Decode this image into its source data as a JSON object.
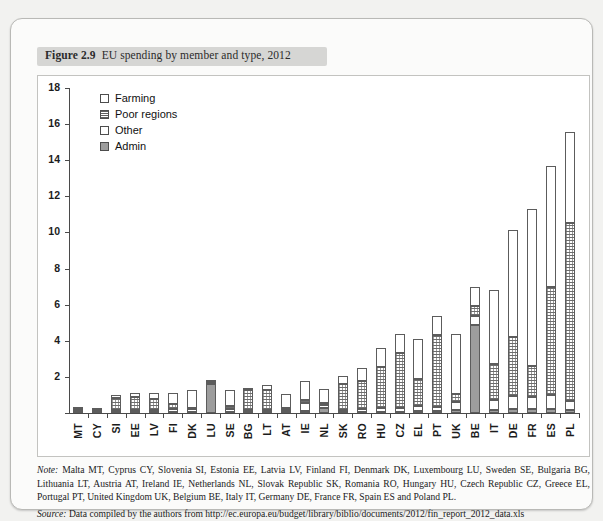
{
  "figure": {
    "label": "Figure 2.9",
    "title": "EU spending by member and type, 2012"
  },
  "note": {
    "prefix": "Note:",
    "text": "Malta MT, Cyprus CY, Slovenia SI, Estonia EE, Latvia LV, Finland FI, Denmark DK, Luxembourg LU, Sweden SE, Bulgaria BG, Lithuania LT, Austria AT, Ireland IE, Netherlands NL, Slovak Republic SK, Romania RO, Hungary HU, Czech Republic CZ, Greece EL, Portugal PT, United Kingdom UK, Belgium BE, Italy IT, Germany DE, France FR, Spain ES and Poland PL."
  },
  "source": {
    "prefix": "Source:",
    "text": "Data compiled by the authors from http://ec.europa.eu/budget/library/biblio/documents/2012/fin_report_2012_data.xls"
  },
  "chart_data": {
    "type": "bar",
    "stacked": true,
    "title": "EU spending by member and type, 2012",
    "xlabel": "",
    "ylabel": "",
    "ylim": [
      0,
      18
    ],
    "yticks": [
      0,
      2,
      4,
      6,
      8,
      10,
      12,
      14,
      16,
      18
    ],
    "grid": false,
    "legend_position": "top-left",
    "categories": [
      "MT",
      "CY",
      "SI",
      "EE",
      "LV",
      "FI",
      "DK",
      "LU",
      "SE",
      "BG",
      "LT",
      "AT",
      "IE",
      "NL",
      "SK",
      "RO",
      "HU",
      "CZ",
      "EL",
      "PT",
      "UK",
      "BE",
      "IT",
      "DE",
      "FR",
      "ES",
      "PL"
    ],
    "series": [
      {
        "name": "Farming",
        "color": "#ffffff",
        "pattern": "empty",
        "values": [
          0.05,
          0.03,
          0.15,
          0.2,
          0.3,
          0.6,
          0.95,
          0.05,
          0.85,
          0.15,
          0.25,
          0.75,
          1.05,
          0.8,
          0.45,
          0.7,
          1.05,
          1.1,
          2.2,
          1.1,
          3.35,
          1.1,
          4.1,
          5.95,
          8.7,
          6.7,
          5.0
        ]
      },
      {
        "name": "Poor regions",
        "color": "#ffffff",
        "pattern": "hatched",
        "values": [
          0.1,
          0.1,
          0.7,
          0.75,
          0.65,
          0.25,
          0.08,
          0.05,
          0.18,
          1.1,
          1.15,
          0.12,
          0.15,
          0.1,
          1.45,
          1.6,
          2.25,
          3.0,
          1.5,
          3.95,
          0.45,
          0.55,
          2.0,
          3.25,
          1.7,
          6.0,
          9.9
        ]
      },
      {
        "name": "Other",
        "color": "#ffffff",
        "pattern": "empty",
        "values": [
          0.04,
          0.03,
          0.1,
          0.1,
          0.1,
          0.18,
          0.15,
          0.05,
          0.15,
          0.1,
          0.1,
          0.12,
          0.45,
          0.15,
          0.1,
          0.15,
          0.25,
          0.25,
          0.3,
          0.25,
          0.45,
          0.45,
          0.55,
          0.7,
          0.7,
          0.8,
          0.5
        ]
      },
      {
        "name": "Admin",
        "color": "#9d9d9d",
        "pattern": "solid",
        "values": [
          0.06,
          0.04,
          0.05,
          0.05,
          0.05,
          0.07,
          0.07,
          1.6,
          0.07,
          0.05,
          0.05,
          0.06,
          0.1,
          0.3,
          0.05,
          0.05,
          0.05,
          0.05,
          0.1,
          0.1,
          0.15,
          4.9,
          0.15,
          0.25,
          0.2,
          0.2,
          0.15
        ]
      }
    ],
    "totals": [
      0.25,
      0.2,
      1.0,
      1.1,
      1.1,
      1.1,
      1.25,
      1.75,
      1.25,
      1.4,
      1.55,
      1.05,
      1.75,
      1.35,
      2.05,
      2.5,
      3.6,
      4.2,
      4.1,
      5.4,
      4.4,
      7.0,
      6.8,
      10.15,
      11.3,
      13.7,
      15.55
    ],
    "legend": [
      "Farming",
      "Poor regions",
      "Other",
      "Admin"
    ]
  }
}
